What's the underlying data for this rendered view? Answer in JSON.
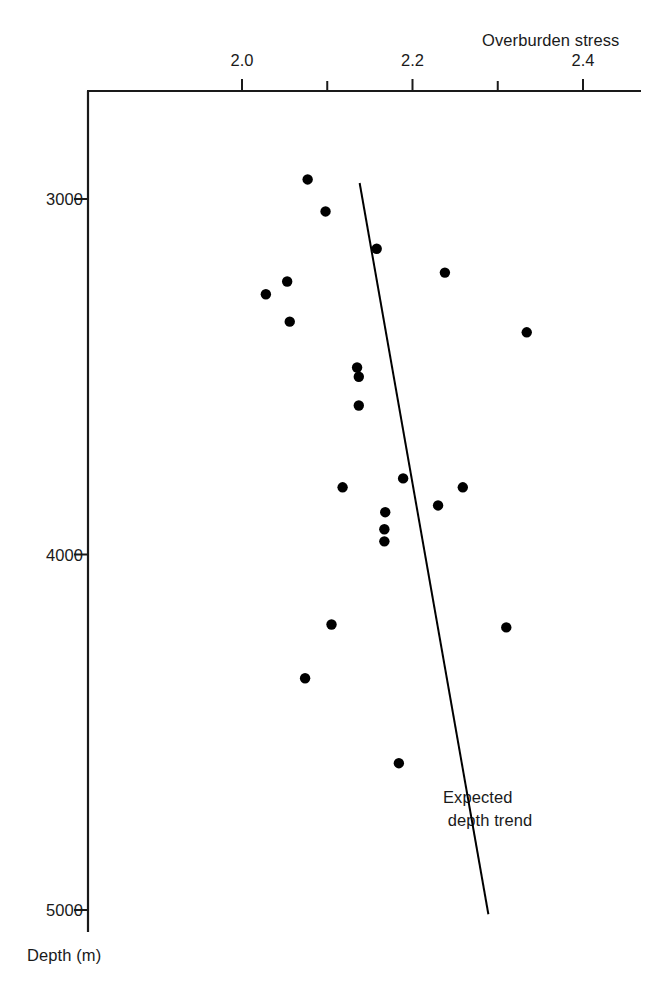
{
  "chart_data": {
    "type": "scatter",
    "title": "",
    "xlabel": "Overburden stress",
    "ylabel": "Depth (m)",
    "xlim": [
      1.93,
      2.47
    ],
    "ylim": [
      2800,
      5030
    ],
    "y_axis_inverted": true,
    "grid": false,
    "legend": null,
    "x_major_ticks": [
      2.0,
      2.2,
      2.4
    ],
    "x_major_tick_labels": [
      "2.0",
      "2.2",
      "2.4"
    ],
    "x_minor_ticks": [
      2.1,
      2.3
    ],
    "y_major_ticks": [
      3000,
      4000,
      5000
    ],
    "y_major_tick_labels": [
      "3000",
      "4000",
      "5000"
    ],
    "x_axis_position": "top",
    "y_axis_position": "left",
    "series": [
      {
        "name": "Overburden stress measurements",
        "marker": "filled-circle",
        "color": "#000000",
        "points": [
          {
            "x": 2.077,
            "y": 2945
          },
          {
            "x": 2.098,
            "y": 3035
          },
          {
            "x": 2.158,
            "y": 3140
          },
          {
            "x": 2.238,
            "y": 3207
          },
          {
            "x": 2.053,
            "y": 3232
          },
          {
            "x": 2.028,
            "y": 3268
          },
          {
            "x": 2.056,
            "y": 3345
          },
          {
            "x": 2.334,
            "y": 3375
          },
          {
            "x": 2.135,
            "y": 3474
          },
          {
            "x": 2.137,
            "y": 3500
          },
          {
            "x": 2.137,
            "y": 3581
          },
          {
            "x": 2.118,
            "y": 3811
          },
          {
            "x": 2.189,
            "y": 3786
          },
          {
            "x": 2.259,
            "y": 3811
          },
          {
            "x": 2.23,
            "y": 3862
          },
          {
            "x": 2.168,
            "y": 3881
          },
          {
            "x": 2.167,
            "y": 3929
          },
          {
            "x": 2.167,
            "y": 3963
          },
          {
            "x": 2.105,
            "y": 4197
          },
          {
            "x": 2.31,
            "y": 4205
          },
          {
            "x": 2.074,
            "y": 4348
          },
          {
            "x": 2.184,
            "y": 4587
          }
        ]
      }
    ],
    "trend_line": {
      "label": "Expected\n depth trend",
      "color": "#000000",
      "start": {
        "x": 2.138,
        "y": 2955
      },
      "end": {
        "x": 2.289,
        "y": 5012
      }
    },
    "annotations": [
      {
        "text_line_1": "Expected",
        "text_line_2": " depth trend"
      }
    ]
  },
  "labels": {
    "x_axis_title": "Overburden stress",
    "y_axis_title": "Depth (m)",
    "annotation_line_1": "Expected",
    "annotation_line_2": " depth trend"
  },
  "colors": {
    "axis": "#1a1a1a",
    "marker": "#000000",
    "trend": "#000000",
    "background": "#ffffff"
  }
}
